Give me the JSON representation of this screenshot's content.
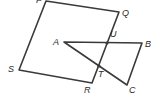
{
  "diagram": {
    "type": "geometry",
    "stroke_color": "#3a3a3a",
    "label_color": "#2a2a2a",
    "points": {
      "P": {
        "x": 46,
        "y": 1,
        "label": "P",
        "lx": 36,
        "ly": 3
      },
      "Q": {
        "x": 119,
        "y": 12,
        "label": "Q",
        "lx": 122,
        "ly": 16
      },
      "R": {
        "x": 92,
        "y": 83,
        "label": "R",
        "lx": 84,
        "ly": 93
      },
      "S": {
        "x": 19,
        "y": 70,
        "label": "S",
        "lx": 8,
        "ly": 72
      },
      "A": {
        "x": 64,
        "y": 42,
        "label": "A",
        "lx": 53,
        "ly": 45
      },
      "B": {
        "x": 142,
        "y": 43,
        "label": "B",
        "lx": 145,
        "ly": 47
      },
      "C": {
        "x": 127,
        "y": 85,
        "label": "C",
        "lx": 129,
        "ly": 93
      },
      "U": {
        "x": 107,
        "y": 43,
        "label": "U",
        "lx": 110,
        "ly": 37
      },
      "T": {
        "x": 99,
        "y": 66,
        "label": "T",
        "lx": 98,
        "ly": 77
      }
    },
    "quadrilateral": [
      "P",
      "Q",
      "R",
      "S"
    ],
    "triangle": [
      "A",
      "B",
      "C"
    ],
    "marked_points": [
      "U",
      "T"
    ]
  }
}
